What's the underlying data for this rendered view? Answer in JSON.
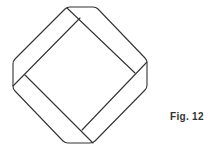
{
  "figure": {
    "caption": "Fig. 12",
    "stroke_color": "#333333"
  }
}
